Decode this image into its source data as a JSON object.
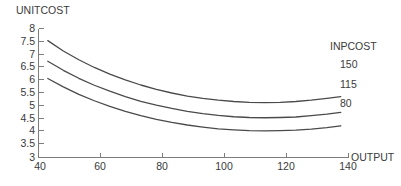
{
  "chart_data": {
    "type": "line",
    "title": "",
    "xlabel": "OUTPUT",
    "ylabel": "UNITCOST",
    "xlim": [
      40,
      140
    ],
    "ylim": [
      3,
      8
    ],
    "xticks": [
      "40",
      "60",
      "80",
      "100",
      "120",
      "140"
    ],
    "yticks": [
      "8",
      "7.5",
      "7",
      "6.5",
      "6",
      "5.5",
      "5",
      "4.5",
      "4",
      "3.5",
      "3"
    ],
    "grid": false,
    "legend_title": "INPCOST",
    "legend_position": "right",
    "x": [
      43,
      48,
      53,
      58,
      63,
      68,
      73,
      78,
      83,
      88,
      93,
      98,
      103,
      108,
      113,
      118,
      123,
      128,
      133,
      137.5
    ],
    "series": [
      {
        "name": "150",
        "label": "150",
        "color": "#4a4a4a",
        "values": [
          7.53,
          7.13,
          6.79,
          6.49,
          6.23,
          6.01,
          5.81,
          5.64,
          5.5,
          5.38,
          5.29,
          5.22,
          5.17,
          5.14,
          5.13,
          5.14,
          5.17,
          5.22,
          5.29,
          5.36
        ]
      },
      {
        "name": "115",
        "label": "115",
        "color": "#4a4a4a",
        "values": [
          6.73,
          6.38,
          6.07,
          5.8,
          5.57,
          5.36,
          5.18,
          5.03,
          4.9,
          4.79,
          4.7,
          4.63,
          4.58,
          4.55,
          4.54,
          4.55,
          4.57,
          4.62,
          4.68,
          4.75
        ]
      },
      {
        "name": "80",
        "label": "80",
        "color": "#4a4a4a",
        "values": [
          6.06,
          5.74,
          5.45,
          5.2,
          4.98,
          4.79,
          4.62,
          4.48,
          4.36,
          4.26,
          4.18,
          4.11,
          4.07,
          4.04,
          4.03,
          4.04,
          4.06,
          4.1,
          4.16,
          4.23
        ]
      }
    ]
  },
  "labels": {
    "y_axis_title": "UNITCOST",
    "x_axis_title": "OUTPUT",
    "legend_title": "INPCOST",
    "legend_150": "150",
    "legend_115": "115",
    "legend_80": "80",
    "y_8": "8",
    "y_75": "7.5",
    "y_7": "7",
    "y_65": "6.5",
    "y_6": "6",
    "y_55": "5.5",
    "y_5": "5",
    "y_45": "4.5",
    "y_4": "4",
    "y_35": "3.5",
    "y_3": "3",
    "x_40": "40",
    "x_60": "60",
    "x_80": "80",
    "x_100": "100",
    "x_120": "120",
    "x_140": "140"
  }
}
